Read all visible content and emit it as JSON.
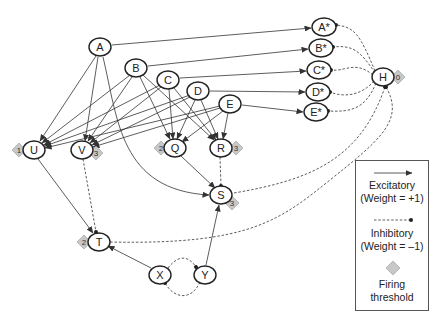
{
  "nodes": {
    "A": {
      "label": "A"
    },
    "B": {
      "label": "B"
    },
    "C": {
      "label": "C"
    },
    "D": {
      "label": "D"
    },
    "E": {
      "label": "E"
    },
    "U": {
      "label": "U",
      "threshold": "1"
    },
    "V": {
      "label": "V",
      "threshold": "3"
    },
    "Q": {
      "label": "Q",
      "threshold": "2"
    },
    "R": {
      "label": "R",
      "threshold": "3"
    },
    "S": {
      "label": "S",
      "threshold": "3"
    },
    "T": {
      "label": "T",
      "threshold": "2"
    },
    "X": {
      "label": "X"
    },
    "Y": {
      "label": "Y"
    },
    "As": {
      "label": "A*"
    },
    "Bs": {
      "label": "B*"
    },
    "Cs": {
      "label": "C*"
    },
    "Ds": {
      "label": "D*"
    },
    "Es": {
      "label": "E*"
    },
    "H": {
      "label": "H",
      "threshold": "0"
    }
  },
  "edges": {
    "excitatory": [
      "A→A*",
      "B→B*",
      "C→C*",
      "D→D*",
      "E→E*",
      "A→U",
      "A→V",
      "A→S",
      "B→U",
      "B→V",
      "B→Q",
      "B→R",
      "C→U",
      "C→V",
      "C→Q",
      "C→R",
      "D→U",
      "D→V",
      "D→Q",
      "D→R",
      "E→U",
      "E→V",
      "E→Q",
      "E→R",
      "U→T",
      "Q→S",
      "Y→S",
      "X→T"
    ],
    "inhibitory": [
      "H→A*",
      "H→B*",
      "H→C*",
      "H→D*",
      "H→E*",
      "S→H",
      "T→H",
      "V→T",
      "R→S",
      "X→Y",
      "Y→X"
    ]
  },
  "legend": {
    "excitatory_line1": "Excitatory",
    "excitatory_line2": "(Weight = +1)",
    "inhibitory_line1": "Inhibitory",
    "inhibitory_line2": "(Weight = –1)",
    "threshold_line1": "Firing",
    "threshold_line2": "threshold"
  }
}
